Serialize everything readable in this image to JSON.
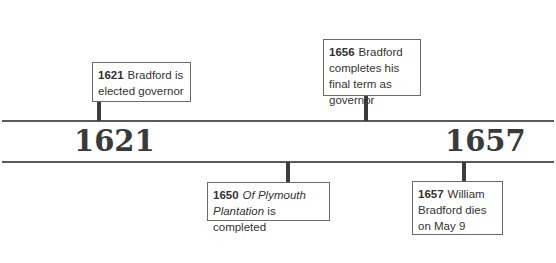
{
  "timeline": {
    "start_year": "1621",
    "end_year": "1657",
    "line_color": "#5a5a5a",
    "connector_color": "#3c3c3c"
  },
  "events": [
    {
      "year": "1621",
      "text": "Bradford is elected governor",
      "position": "above"
    },
    {
      "year": "1656",
      "text": "Bradford completes his final term as governor",
      "position": "above"
    },
    {
      "year": "1650",
      "italic_text": "Of Plymouth Plantation",
      "text": " is completed",
      "position": "below"
    },
    {
      "year": "1657",
      "text": "William Bradford dies on May 9",
      "position": "below"
    }
  ]
}
